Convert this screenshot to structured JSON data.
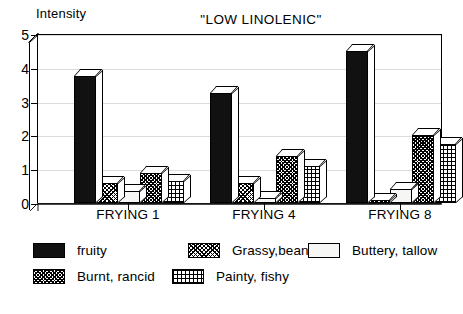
{
  "axis": {
    "ylabel": "Intensity",
    "yticks": [
      "0",
      "1",
      "2",
      "3",
      "4",
      "5"
    ],
    "xticks": [
      "FRYING 1",
      "FRYING 4",
      "FRYING 8"
    ]
  },
  "title": "\"LOW LINOLENIC\"",
  "legend": {
    "row1": [
      {
        "label": "fruity",
        "fill": "solid"
      },
      {
        "label": "Grassy,beany",
        "fill": "cross"
      },
      {
        "label": "Buttery, tallow",
        "fill": "white"
      }
    ],
    "row2": [
      {
        "label": "Burnt, rancid",
        "fill": "hatch"
      },
      {
        "label": "Painty, fishy",
        "fill": "grid"
      }
    ]
  },
  "chart_data": {
    "type": "bar",
    "title": "\"LOW LINOLENIC\"",
    "xlabel": "",
    "ylabel": "Intensity",
    "ylim": [
      0,
      5
    ],
    "ytick_step": 1,
    "grid": true,
    "legend_position": "below",
    "style": "3d-grouped-bar",
    "categories": [
      "FRYING 1",
      "FRYING 4",
      "FRYING 8"
    ],
    "series": [
      {
        "name": "fruity",
        "fill": "solid",
        "values": [
          3.75,
          3.25,
          4.5
        ]
      },
      {
        "name": "Grassy,beany",
        "fill": "cross",
        "values": [
          0.6,
          0.6,
          0.1
        ]
      },
      {
        "name": "Buttery, tallow",
        "fill": "white",
        "values": [
          0.35,
          0.15,
          0.4
        ]
      },
      {
        "name": "Burnt, rancid",
        "fill": "hatch",
        "values": [
          0.9,
          1.4,
          2.0
        ]
      },
      {
        "name": "Painty, fishy",
        "fill": "grid",
        "values": [
          0.65,
          1.1,
          1.75
        ]
      }
    ]
  }
}
